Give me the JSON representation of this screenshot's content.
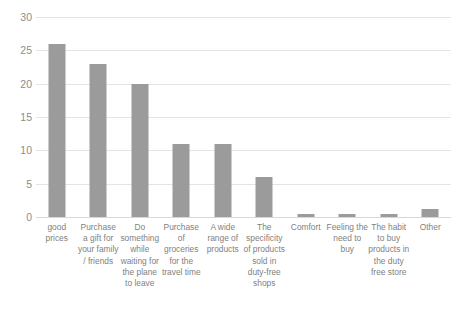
{
  "chart_data": {
    "type": "bar",
    "title": "",
    "xlabel": "",
    "ylabel": "",
    "ylim": [
      0,
      30
    ],
    "yticks": [
      0,
      5,
      10,
      15,
      20,
      25,
      30
    ],
    "grid": true,
    "legend": false,
    "bar_color": "#9b9b9b",
    "gridline_color": "#e4e4e4",
    "tick_label_color": "#8d8d8d",
    "categories": [
      "good prices",
      "Purchase a gift for your family / friends",
      "Do something while waiting for the plane to leave",
      "Purchase of groceries for the travel time",
      "A wide range of products",
      "The specificity of products sold in duty-free shops",
      "Comfort",
      "Feeling the need to buy",
      "The habit to buy products in the duty free store",
      "Other"
    ],
    "values": [
      26,
      23,
      20,
      11,
      11,
      6,
      0.4,
      0.4,
      0.4,
      1.2
    ]
  }
}
